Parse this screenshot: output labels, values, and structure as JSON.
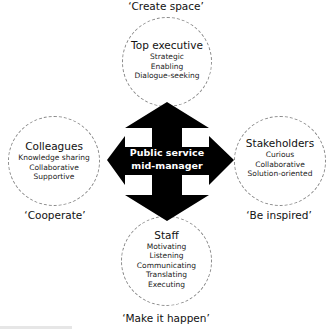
{
  "diagram": {
    "center": {
      "lines": [
        "Public service",
        "mid-manager"
      ]
    },
    "nodes": {
      "top": {
        "title": "Top executive",
        "items": [
          "Strategic",
          "Enabling",
          "Dialogue-seeking"
        ],
        "motto": "‘Create space’"
      },
      "left": {
        "title": "Colleagues",
        "items": [
          "Knowledge sharing",
          "Collaborative",
          "Supportive"
        ],
        "motto": "‘Cooperate’"
      },
      "right": {
        "title": "Stakeholders",
        "items": [
          "Curious",
          "Collaborative",
          "Solution-oriented"
        ],
        "motto": "‘Be inspired’"
      },
      "bottom": {
        "title": "Staff",
        "items": [
          "Motivating",
          "Listening",
          "Communicating",
          "Translating",
          "Executing"
        ],
        "motto": "‘Make it happen’"
      }
    },
    "colors": {
      "arrow": "#000000",
      "circle_border": "#8a8a8a",
      "text": "#111111",
      "center_text": "#ffffff"
    }
  }
}
